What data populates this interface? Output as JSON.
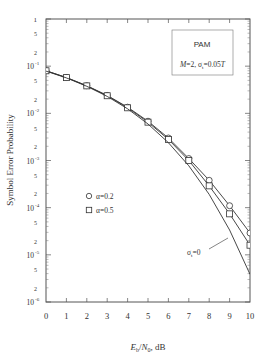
{
  "chart_data": {
    "type": "line",
    "title": "",
    "xlabel": "E_b/N_0, dB",
    "ylabel": "Symbol Error Probability",
    "x": [
      0,
      1,
      2,
      3,
      4,
      5,
      6,
      7,
      8,
      9,
      10
    ],
    "xlim": [
      0,
      10
    ],
    "ylim": [
      1e-06,
      1
    ],
    "yscale": "log",
    "x_ticks": [
      "0",
      "1",
      "2",
      "3",
      "4",
      "5",
      "6",
      "7",
      "8",
      "9",
      "10"
    ],
    "y_ticks": [
      "1",
      "5",
      "2",
      "10^-1",
      "5",
      "2",
      "10^-2",
      "5",
      "2",
      "10^-3",
      "5",
      "2",
      "10^-4",
      "5",
      "2",
      "10^-5",
      "5",
      "2",
      "10^-6"
    ],
    "grid": false,
    "series": [
      {
        "name": "α=0.2",
        "marker": "circle",
        "values": [
          0.08,
          0.0575,
          0.0385,
          0.024,
          0.0135,
          0.0068,
          0.003,
          0.0011,
          0.00038,
          0.00011,
          2.9e-05
        ]
      },
      {
        "name": "α=0.5",
        "marker": "square",
        "values": [
          0.0798,
          0.0572,
          0.0382,
          0.0236,
          0.0131,
          0.0065,
          0.0028,
          0.001,
          0.00029,
          7.4e-05,
          1.6e-05
        ]
      },
      {
        "name": "σ_t=0",
        "marker": "none",
        "values": [
          0.0786,
          0.0563,
          0.0375,
          0.0229,
          0.0125,
          0.00595,
          0.00239,
          0.000773,
          0.000191,
          3.36e-05,
          3.87e-06
        ]
      }
    ],
    "legend": {
      "position": "left-middle",
      "entries": [
        "α=0.2",
        "α=0.5"
      ]
    },
    "annotations": [
      {
        "text": "PAM",
        "box": true
      },
      {
        "text": "M=2,  σ_t=0.05T",
        "box": true
      },
      {
        "text": "σ_t=0",
        "points_to": "σ_t=0 curve near x=9"
      }
    ]
  },
  "labels": {
    "ylabel": "Symbol Error Probability",
    "xlabel_main": "E",
    "xlabel_sub1": "b",
    "xlabel_mid": "/N",
    "xlabel_sub2": "0",
    "xlabel_tail": ",  dB",
    "box_line1": "PAM",
    "legend_a": "α=0.2",
    "legend_b": "α=0.5",
    "curve_label": "σ",
    "curve_label_sub": "t",
    "curve_label_tail": "=0"
  }
}
